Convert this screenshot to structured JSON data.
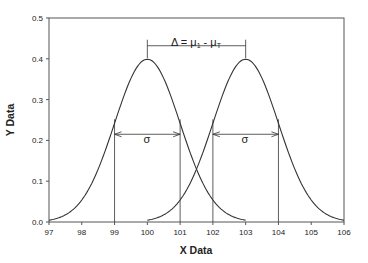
{
  "chart_data": {
    "type": "line",
    "title": "",
    "xlabel": "X Data",
    "ylabel": "Y Data",
    "xlim": [
      97,
      106
    ],
    "ylim": [
      0.0,
      0.5
    ],
    "x_ticks": [
      97,
      98,
      99,
      100,
      101,
      102,
      103,
      104,
      105,
      106
    ],
    "y_ticks": [
      0.0,
      0.1,
      0.2,
      0.3,
      0.4,
      0.5
    ],
    "y_tick_labels": [
      "0.0",
      "0.1",
      "0.2",
      "0.3",
      "0.4",
      "0.5"
    ],
    "grid": false,
    "legend": null,
    "series": [
      {
        "name": "Distribution 1",
        "kind": "normal_pdf",
        "mean": 100,
        "sd": 1,
        "x_range": [
          97,
          103
        ],
        "peak": 0.399
      },
      {
        "name": "Distribution 2",
        "kind": "normal_pdf",
        "mean": 103,
        "sd": 1,
        "x_range": [
          100,
          106
        ],
        "peak": 0.399
      }
    ],
    "annotations": {
      "delta_label": "Δ = μ",
      "delta_sub1": "1",
      "delta_mid": " - μ",
      "delta_sub2": "T",
      "delta_bracket": {
        "x_start": 100,
        "x_end": 103,
        "y": 0.432
      },
      "sigma_label": "σ",
      "sigma_arrows": [
        {
          "x_start": 99,
          "x_end": 101,
          "y": 0.215
        },
        {
          "x_start": 102,
          "x_end": 104,
          "y": 0.215
        }
      ],
      "vertical_lines": [
        99,
        101,
        102,
        104
      ]
    }
  },
  "colors": {
    "line": "#333333",
    "axis": "#555555",
    "text": "#222222"
  }
}
